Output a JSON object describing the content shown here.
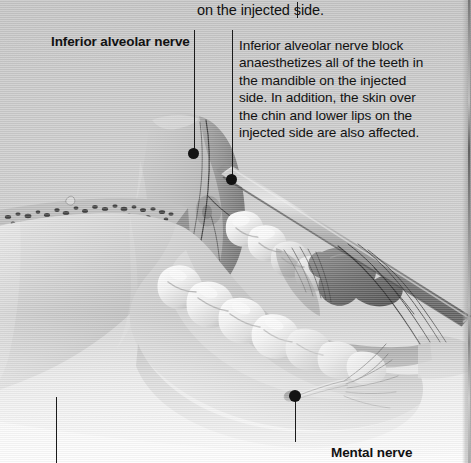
{
  "figure": {
    "kind": "anatomical-illustration",
    "rendering": "grayscale halftone print scan",
    "background_color": "#cccccc",
    "ink_color": "#121212"
  },
  "text": {
    "carryover_line": "on the injected side.",
    "label_inferior_alveolar_nerve": "Inferior alveolar nerve",
    "label_mental_nerve": "Mental nerve",
    "note": {
      "heading": "Inferior alveolar nerve block",
      "body": "anaesthetizes all of the teeth in the mandible on the injected side. In addition, the skin over the chin and lower lips on the injected side are also affected."
    }
  },
  "callouts": [
    {
      "name": "carryover-rule",
      "x": 297,
      "y": 2,
      "length": 14,
      "orientation": "vertical"
    },
    {
      "name": "inferior-alveolar-nerve-leader",
      "x": 194,
      "y_start": 30,
      "y_end": 154,
      "dot_x": 194,
      "dot_y": 154,
      "dot_r": 5
    },
    {
      "name": "note-leader",
      "x": 232,
      "y_start": 30,
      "y_end": 180,
      "dot_x": 232,
      "dot_y": 180,
      "dot_r": 5
    },
    {
      "name": "mental-nerve-leader",
      "x": 295,
      "y_start": 397,
      "y_end": 441,
      "dot_x": 295,
      "dot_y": 397,
      "dot_r": 5
    },
    {
      "name": "lower-left-leader",
      "x": 56,
      "y_start": 397,
      "y_end": 463,
      "dot_x": 56,
      "dot_y": 397,
      "dot_r": 0
    }
  ],
  "anatomy_parts": [
    {
      "name": "mandible-body",
      "label": "body of mandible"
    },
    {
      "name": "mandible-ramus",
      "label": "ramus of mandible"
    },
    {
      "name": "cut-bone-cross-section",
      "label": "cancellous bone cross-section"
    },
    {
      "name": "mandibular-teeth",
      "label": "lower teeth row"
    },
    {
      "name": "tongue",
      "label": "tongue"
    },
    {
      "name": "syringe-needle",
      "label": "dental syringe needle"
    },
    {
      "name": "nerve-branches",
      "label": "nerve fibre branches"
    },
    {
      "name": "mental-foramen",
      "label": "mental foramen"
    }
  ]
}
